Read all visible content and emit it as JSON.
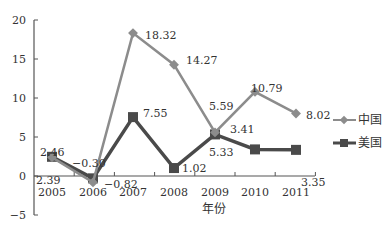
{
  "chart_data": {
    "type": "line",
    "title": "",
    "xlabel": "年份",
    "ylabel": "",
    "categories": [
      "2005",
      "2006",
      "2007",
      "2008",
      "2009",
      "2010",
      "2011"
    ],
    "ylim": [
      -5,
      20
    ],
    "yticks": [
      -5,
      0,
      5,
      10,
      15,
      20
    ],
    "grid": false,
    "legend_position": "right",
    "series": [
      {
        "name": "中国",
        "values": [
          2.39,
          -0.82,
          18.32,
          14.27,
          5.59,
          10.79,
          8.02
        ],
        "labels": [
          "2.39",
          "−0.82",
          "18.32",
          "14.27",
          "5.59",
          "10.79",
          "8.02"
        ],
        "marker": "diamond",
        "color": "#8c8c8c"
      },
      {
        "name": "美国",
        "values": [
          2.46,
          -0.3,
          7.55,
          1.02,
          5.33,
          3.41,
          3.35
        ],
        "labels": [
          "2.46",
          "−0.30",
          "7.55",
          "1.02",
          "5.33",
          "3.41",
          "3.35"
        ],
        "marker": "square",
        "color": "#4a4a4a"
      }
    ]
  },
  "axis": {
    "ytick_labels": [
      "−5",
      "0",
      "5",
      "10",
      "15",
      "20"
    ],
    "xtick_labels": [
      "2005",
      "2006",
      "2007",
      "2008",
      "2009",
      "2010",
      "2011"
    ],
    "xlabel": "年份"
  },
  "legend": {
    "china": "中国",
    "usa": "美国"
  }
}
